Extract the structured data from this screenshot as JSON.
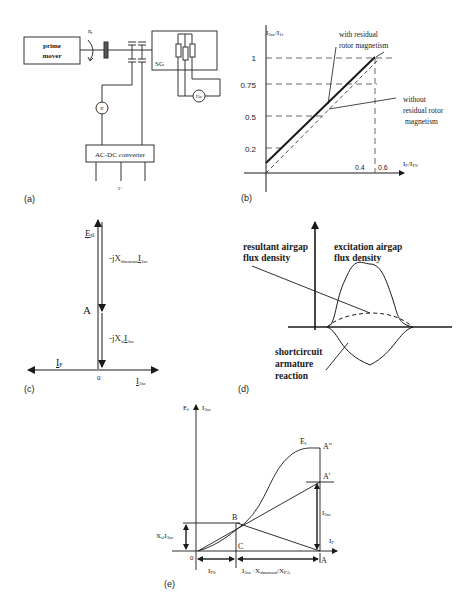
{
  "panels": {
    "a": {
      "label": "(a)",
      "prime_mover": [
        "prime",
        "mover"
      ],
      "speed": "n",
      "speed_sub": "r",
      "generator": "SG",
      "ammeter_field": "I",
      "ammeter_field_sub": "F",
      "ammeter_sc": "I",
      "ammeter_sc_sub": "3sc",
      "converter": "AC-DC converter",
      "supply": "3~"
    },
    "b": {
      "label": "(b)",
      "y_axis": "I",
      "y_axis_sub1": "3sc",
      "y_axis_mid": "/I",
      "y_axis_sub2": "1r",
      "x_axis": "I",
      "x_axis_sub1": "F",
      "x_axis_mid": "/I",
      "x_axis_sub2": "F0",
      "y_ticks": [
        "1",
        "0.75",
        "0.5",
        "0.2"
      ],
      "x_ticks": [
        "0.4",
        "0.6"
      ],
      "annot_with": [
        "with residual",
        "rotor magnetism"
      ],
      "annot_without": [
        "without",
        "residual rotor",
        "magnetism"
      ]
    },
    "c": {
      "label": "(c)",
      "e": "E",
      "e_sub": "sl",
      "x_dm_prefix": "-jX",
      "x_dm_sub": "dmunsat",
      "x_dm_i": "I",
      "x_dm_i_sub": "3sc",
      "point_a": "A",
      "x_sl_prefix": "-jX",
      "x_sl_sub": "sl",
      "x_sl_i": "I",
      "x_sl_i_sub": "3sc",
      "origin": "0",
      "i_f": "I",
      "i_f_sub": "F",
      "i_3sc": "I",
      "i_3sc_sub": "3sc"
    },
    "d": {
      "label": "(d)",
      "resultant": [
        "resultant airgap",
        "flux density"
      ],
      "excitation": [
        "excitation airgap",
        "flux density"
      ],
      "armature": [
        "shortcircuit",
        "armature",
        "reaction"
      ]
    },
    "e": {
      "label": "(e)",
      "y1": "E",
      "y1_sub": "l",
      "y2": "I",
      "y2_sub": "3sc",
      "curve": "E",
      "curve_sub": "l",
      "a2": "A\"",
      "a1": "A'",
      "b": "B",
      "c": "C",
      "a": "A",
      "origin": "0",
      "i_f": "I",
      "i_f_sub": "F",
      "i3sc": "I",
      "i3sc_sub": "3sc",
      "xsl": "X",
      "xsl_sub": "sl",
      "xsl_i": "I",
      "xsl_i_sub": "3sc",
      "if0": "I",
      "if0_sub": "F0",
      "bottom_expr": "I",
      "bottom_expr_sub1": "3sc",
      "bottom_expr_mid": " ·X",
      "bottom_expr_sub2": "dmunsat",
      "bottom_expr_mid2": "/X",
      "bottom_expr_sub3": "FA"
    }
  }
}
